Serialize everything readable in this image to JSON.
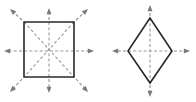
{
  "figure": {
    "canvas": {
      "width": 196,
      "height": 102,
      "background": "#ffffff"
    },
    "colors": {
      "outline": "#282828",
      "dash": "#9a9a9a",
      "arrow": "#7a7a7a",
      "background": "#ffffff"
    },
    "panels": [
      {
        "id": "square-panel",
        "shape_name": "square",
        "center": {
          "x": 49,
          "y": 51
        },
        "vertices": [
          {
            "x": 24,
            "y": 22
          },
          {
            "x": 74,
            "y": 22
          },
          {
            "x": 74,
            "y": 77
          },
          {
            "x": 24,
            "y": 77
          }
        ],
        "internal_dashed_axes": [
          {
            "name": "horizontal-axis",
            "x1": 24,
            "y1": 51,
            "x2": 74,
            "y2": 51
          },
          {
            "name": "vertical-axis",
            "x1": 49,
            "y1": 22,
            "x2": 49,
            "y2": 77
          },
          {
            "name": "diagonal-axis-nwse",
            "x1": 24,
            "y1": 22,
            "x2": 74,
            "y2": 77
          },
          {
            "name": "diagonal-axis-nesw",
            "x1": 74,
            "y1": 22,
            "x2": 24,
            "y2": 77
          }
        ],
        "arrows": [
          {
            "name": "arrow-up",
            "x1": 49,
            "y1": 20,
            "x2": 49,
            "y2": 8
          },
          {
            "name": "arrow-down",
            "x1": 49,
            "y1": 79,
            "x2": 49,
            "y2": 93
          },
          {
            "name": "arrow-left",
            "x1": 22,
            "y1": 51,
            "x2": 4,
            "y2": 51
          },
          {
            "name": "arrow-right",
            "x1": 76,
            "y1": 51,
            "x2": 94,
            "y2": 51
          },
          {
            "name": "arrow-up-left",
            "x1": 22,
            "y1": 20,
            "x2": 10,
            "y2": 9
          },
          {
            "name": "arrow-up-right",
            "x1": 76,
            "y1": 20,
            "x2": 88,
            "y2": 9
          },
          {
            "name": "arrow-down-left",
            "x1": 22,
            "y1": 79,
            "x2": 10,
            "y2": 92
          },
          {
            "name": "arrow-down-right",
            "x1": 76,
            "y1": 79,
            "x2": 88,
            "y2": 92
          }
        ]
      },
      {
        "id": "rhombus-panel",
        "shape_name": "rhombus",
        "center": {
          "x": 150,
          "y": 51
        },
        "vertices": [
          {
            "x": 150,
            "y": 18
          },
          {
            "x": 172,
            "y": 51
          },
          {
            "x": 150,
            "y": 83
          },
          {
            "x": 128,
            "y": 51
          }
        ],
        "internal_dashed_axes": [
          {
            "name": "horizontal-axis",
            "x1": 128,
            "y1": 51,
            "x2": 172,
            "y2": 51
          },
          {
            "name": "vertical-axis",
            "x1": 150,
            "y1": 18,
            "x2": 150,
            "y2": 83
          }
        ],
        "arrows": [
          {
            "name": "arrow-up",
            "x1": 150,
            "y1": 16,
            "x2": 150,
            "y2": 5
          },
          {
            "name": "arrow-down",
            "x1": 150,
            "y1": 85,
            "x2": 150,
            "y2": 97
          },
          {
            "name": "arrow-left",
            "x1": 126,
            "y1": 51,
            "x2": 112,
            "y2": 51
          },
          {
            "name": "arrow-right",
            "x1": 174,
            "y1": 51,
            "x2": 190,
            "y2": 51
          }
        ]
      }
    ]
  }
}
